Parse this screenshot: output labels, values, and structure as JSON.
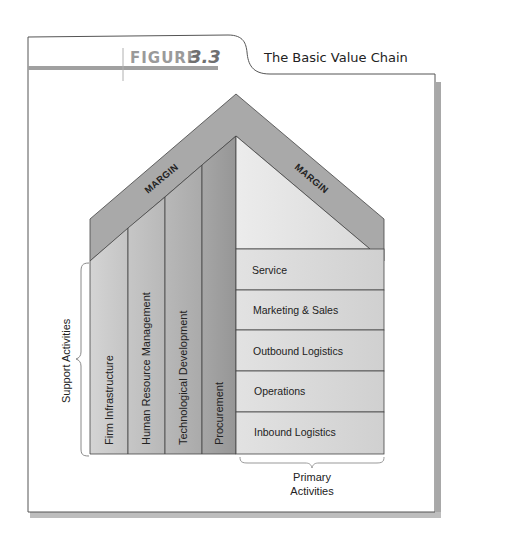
{
  "figure": {
    "label_word": "FIGURE",
    "label_number": "3.3",
    "title": "The Basic Value Chain"
  },
  "diagram": {
    "margin_left": "MARGIN",
    "margin_right": "MARGIN",
    "support_activities_label": "Support Activities",
    "support_activities": [
      "Firm Infrastructure",
      "Human Resource Management",
      "Technological Development",
      "Procurement"
    ],
    "primary_activities_label_line1": "Primary",
    "primary_activities_label_line2": "Activities",
    "primary_activities": [
      "Service",
      "Marketing & Sales",
      "Outbound Logistics",
      "Operations",
      "Inbound Logistics"
    ]
  },
  "colors": {
    "roof": "#a9a9a9",
    "col1": "#cacaca",
    "col2": "#bdbdbd",
    "col3": "#b0b0b0",
    "col4": "#9e9e9e",
    "primary": "#d9d9d9",
    "gable": "#e4e4e4",
    "frame_shadow": "#a8a8a8",
    "header_bar": "#a0a0a0"
  }
}
